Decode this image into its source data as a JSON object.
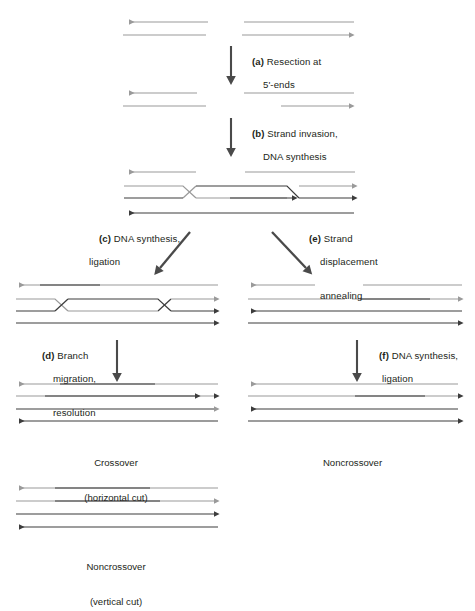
{
  "figure": {
    "colors": {
      "light_strand": "#9a9a9a",
      "dark_strand": "#3c3c3c",
      "arrow_gray": "#6e6e6e",
      "text": "#231f20",
      "background": "#ffffff"
    }
  },
  "steps": [
    {
      "id": "a",
      "tag": "(a)",
      "line1": "Resection at",
      "line2": "5'-ends"
    },
    {
      "id": "b",
      "tag": "(b)",
      "line1": "Strand invasion,",
      "line2": "DNA synthesis"
    },
    {
      "id": "c",
      "tag": "(c)",
      "line1": "DNA synthesis,",
      "line2": "ligation"
    },
    {
      "id": "e",
      "tag": "(e)",
      "line1": "Strand",
      "line2": "displacement",
      "line3": "annealing"
    },
    {
      "id": "d",
      "tag": "(d)",
      "line1": "Branch",
      "line2": "migration,",
      "line3": "resolution"
    },
    {
      "id": "f",
      "tag": "(f)",
      "line1": "DNA synthesis,",
      "line2": "ligation"
    }
  ],
  "outcomes": [
    {
      "id": "crossover",
      "line1": "Crossover",
      "line2": "(horizontal cut)"
    },
    {
      "id": "noncrossover-sdsa",
      "line1": "Noncrossover",
      "line2": ""
    },
    {
      "id": "noncrossover-vertical",
      "line1": "Noncrossover",
      "line2": "(vertical cut)"
    }
  ],
  "panels": {
    "p1": {
      "name": "broken-duplex"
    },
    "p2": {
      "name": "resected-duplex"
    },
    "p3": {
      "name": "strand-invasion-d-loop"
    },
    "p4": {
      "name": "double-holliday-junction"
    },
    "p5": {
      "name": "displaced-annealed-duplex"
    },
    "p6": {
      "name": "crossover-products"
    },
    "p7": {
      "name": "noncrossover-products-sdsa"
    },
    "p8": {
      "name": "noncrossover-products-vertical"
    }
  }
}
